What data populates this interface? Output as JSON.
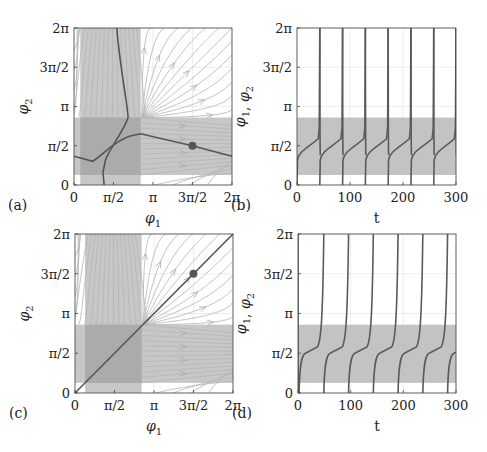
{
  "chart_data": [
    {
      "panel": "(a)",
      "type": "line",
      "subtype": "phase-portrait",
      "xlabel": "φ1",
      "ylabel": "φ2",
      "xticks": [
        "0",
        "π/2",
        "π",
        "3π/2",
        "2π"
      ],
      "yticks": [
        "0",
        "π/2",
        "π",
        "3π/2",
        "2π"
      ],
      "xlim": [
        0,
        6.283
      ],
      "ylim": [
        0,
        6.283
      ],
      "shaded_regions": [
        {
          "axis": "phi1",
          "range": [
            0.25,
            2.65
          ],
          "color": "#bdbdbd"
        },
        {
          "axis": "phi2",
          "range": [
            0.4,
            2.7
          ],
          "color": "#bdbdbd"
        }
      ],
      "nullclines": "two dark curves crossing near (1.3, 1.6)",
      "marker": {
        "x": 4.71,
        "y": 1.57,
        "label": "fixed point"
      },
      "streamlines": true,
      "grid": true
    },
    {
      "panel": "(b)",
      "type": "line",
      "xlabel": "t",
      "ylabel": "φ1, φ2",
      "xticks": [
        "0",
        "100",
        "200",
        "300"
      ],
      "yticks": [
        "0",
        "π/2",
        "π",
        "3π/2",
        "2π"
      ],
      "xlim": [
        0,
        300
      ],
      "ylim": [
        0,
        6.283
      ],
      "shaded_band": [
        0.4,
        2.7
      ],
      "period_approx": 43,
      "jump_times": [
        0,
        43,
        86,
        129,
        172,
        215,
        258,
        300
      ],
      "plateau_value_approx": 1.5,
      "grid": true
    },
    {
      "panel": "(c)",
      "type": "line",
      "subtype": "phase-portrait",
      "xlabel": "φ1",
      "ylabel": "φ2",
      "xticks": [
        "0",
        "π/2",
        "π",
        "3π/2",
        "2π"
      ],
      "yticks": [
        "0",
        "π/2",
        "π",
        "3π/2",
        "2π"
      ],
      "xlim": [
        0,
        6.283
      ],
      "ylim": [
        0,
        6.283
      ],
      "shaded_regions": [
        {
          "axis": "phi1",
          "range": [
            0.4,
            2.65
          ],
          "color": "#bdbdbd"
        },
        {
          "axis": "phi2",
          "range": [
            0.4,
            2.7
          ],
          "color": "#bdbdbd"
        }
      ],
      "diagonal_line": "φ2 = φ1",
      "marker": {
        "x": 4.71,
        "y": 4.71
      },
      "streamlines": true,
      "grid": true
    },
    {
      "panel": "(d)",
      "type": "line",
      "xlabel": "t",
      "ylabel": "φ1, φ2",
      "xticks": [
        "0",
        "100",
        "200",
        "300"
      ],
      "yticks": [
        "0",
        "π/2",
        "π",
        "3π/2",
        "2π"
      ],
      "xlim": [
        0,
        300
      ],
      "ylim": [
        0,
        6.283
      ],
      "shaded_band": [
        0.4,
        2.7
      ],
      "period_approx": 47,
      "jump_times": [
        2,
        49,
        96,
        143,
        190,
        237,
        284
      ],
      "plateau_value_approx": 1.57,
      "grid": true
    }
  ],
  "labels": {
    "a": "(a)",
    "b": "(b)",
    "c": "(c)",
    "d": "(d)",
    "phi1": "φ1",
    "phi2": "φ2",
    "phi12": "φ1, φ2",
    "t": "t"
  },
  "ticks": {
    "pi": [
      "0",
      "π/2",
      "π",
      "3π/2",
      "2π"
    ],
    "t": [
      "0",
      "100",
      "200",
      "300"
    ]
  },
  "colors": {
    "shade": "#bdbdbd",
    "shade_overlap": "#a8a8a8",
    "curve": "#555555",
    "stream": "#b5b5b5"
  }
}
